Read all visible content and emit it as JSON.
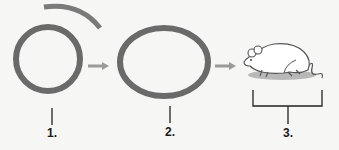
{
  "diagram": {
    "colors": {
      "ring": "#6a6a6a",
      "arc": "#7a7a7a",
      "arrow": "#9a9a9a",
      "line": "#222222",
      "shadow": "#b8b8b8",
      "mouse_outline": "#555555",
      "mouse_fill": "#ffffff"
    },
    "steps": [
      {
        "id": 1,
        "label": "1.",
        "shape": "circle"
      },
      {
        "id": 2,
        "label": "2.",
        "shape": "ellipse"
      },
      {
        "id": 3,
        "label": "3.",
        "shape": "mouse"
      }
    ],
    "connectors": [
      "arrow-1-to-2",
      "arrow-2-to-3"
    ]
  }
}
